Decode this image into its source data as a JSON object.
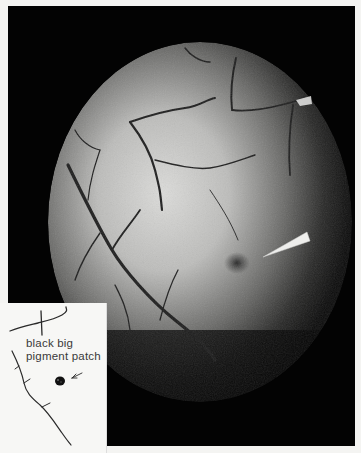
{
  "figure": {
    "pointer": "white wedge pointer",
    "inset": {
      "label_line1": "black big",
      "label_line2": "pigment patch",
      "arrow": "small arrow pointing to patch"
    }
  },
  "colors": {
    "background": "#f4f4f2",
    "frame": "#030303",
    "fundus_center": "#d8d8d6",
    "vessel": "#1e1e1e",
    "pointer": "#eeeeec"
  }
}
